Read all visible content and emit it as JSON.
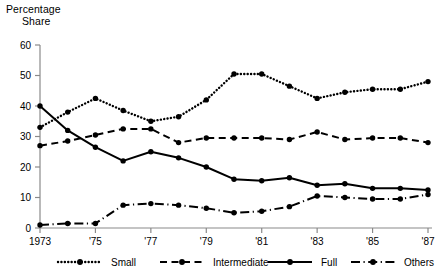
{
  "chart_data": {
    "type": "line",
    "title": "Percentage Share",
    "title_line1": "Percentage",
    "title_line2": "Share",
    "xlabel": "",
    "ylabel": "Percentage Share",
    "ylim": [
      0,
      60
    ],
    "xlim": [
      1973,
      1987
    ],
    "grid": false,
    "legend_position": "bottom",
    "ytick_labels": [
      "0",
      "10",
      "20",
      "30",
      "40",
      "50",
      "60"
    ],
    "ytick_values": [
      0,
      10,
      20,
      30,
      40,
      50,
      60
    ],
    "xtick_labels": [
      "1973",
      "'75",
      "'77",
      "'79",
      "'81",
      "'83",
      "'85",
      "'87"
    ],
    "xtick_values": [
      1973,
      1975,
      1977,
      1979,
      1981,
      1983,
      1985,
      1987
    ],
    "x": [
      1973,
      1974,
      1975,
      1976,
      1977,
      1978,
      1979,
      1980,
      1981,
      1982,
      1983,
      1984,
      1985,
      1986,
      1987
    ],
    "series": [
      {
        "name": "Small",
        "style": "dotted",
        "color": "#000000",
        "values": [
          33,
          38,
          42.5,
          38.5,
          35,
          36.5,
          42,
          50.5,
          50.5,
          46.5,
          42.5,
          44.5,
          45.5,
          45.5,
          48
        ]
      },
      {
        "name": "Intermediate",
        "style": "dashed",
        "color": "#000000",
        "values": [
          27,
          28.5,
          30.5,
          32.5,
          32.5,
          28,
          29.5,
          29.5,
          29.5,
          29,
          31.5,
          29,
          29.5,
          29.5,
          28
        ]
      },
      {
        "name": "Full",
        "style": "solid",
        "color": "#000000",
        "values": [
          40,
          32,
          26.5,
          22,
          25,
          23,
          20,
          16,
          15.5,
          16.5,
          14,
          14.5,
          13,
          13,
          12.5
        ]
      },
      {
        "name": "Others",
        "style": "dashdot",
        "color": "#000000",
        "values": [
          1,
          1.5,
          1.5,
          7.5,
          8,
          7.5,
          6.5,
          5,
          5.5,
          7,
          10.5,
          10,
          9.5,
          9.5,
          11
        ]
      }
    ]
  },
  "legend": {
    "items": [
      {
        "label": "Small",
        "style": "dotted"
      },
      {
        "label": "Intermediate",
        "style": "dashed"
      },
      {
        "label": "Full",
        "style": "solid"
      },
      {
        "label": "Others",
        "style": "dashdot"
      }
    ]
  }
}
